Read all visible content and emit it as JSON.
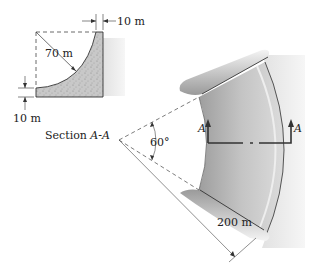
{
  "section": {
    "title_prefix": "Section ",
    "title_italic": "A-A",
    "top_thickness": "10 m",
    "radius": "70 m",
    "bottom_thickness": "10 m"
  },
  "plan": {
    "angle": "60°",
    "radius": "200 m",
    "section_marker_left": "A",
    "section_marker_right": "A"
  },
  "colors": {
    "concrete": "#c9c9c9",
    "dam_face": "#b5b5b5",
    "water": "#e6e6e6",
    "line": "#333333"
  }
}
